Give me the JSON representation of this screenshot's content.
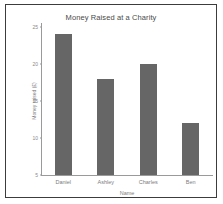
{
  "chart_data": {
    "type": "bar",
    "title": "Money Raised at a Charity",
    "xlabel": "Name",
    "ylabel": "Money raised (£)",
    "categories": [
      "Daniel",
      "Ashley",
      "Charles",
      "Ben"
    ],
    "values": [
      24,
      18,
      20,
      12
    ],
    "ylim": [
      5,
      25
    ],
    "yticks": [
      25,
      20,
      15,
      10,
      5
    ],
    "ytick_labels": [
      "25",
      "20",
      "15",
      "10",
      "5"
    ],
    "grid": false,
    "legend": false,
    "bar_color": "#666666",
    "axis_color": "#9a9a9a",
    "frame_color": "#3c3c3c",
    "text_color": "#7d7d7d",
    "title_color": "#4a4a4a"
  }
}
